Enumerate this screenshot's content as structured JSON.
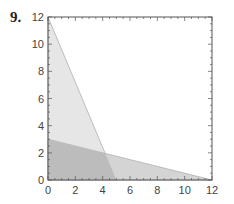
{
  "problem": {
    "number": "9."
  },
  "chart_data": {
    "type": "area",
    "title": "",
    "xlabel": "",
    "ylabel": "",
    "xlim": [
      0,
      12
    ],
    "ylim": [
      0,
      12
    ],
    "xticks": [
      0,
      2,
      4,
      6,
      8,
      10,
      12
    ],
    "yticks": [
      0,
      2,
      4,
      6,
      8,
      10,
      12
    ],
    "xtick_labels": [
      "0",
      "2",
      "4",
      "6",
      "8",
      "10",
      "12"
    ],
    "ytick_labels": [
      "0",
      "2",
      "4",
      "6",
      "8",
      "10",
      "12"
    ],
    "grid": false,
    "legend": null,
    "regions": [
      {
        "name": "steep-triangle",
        "vertices": [
          [
            0,
            0
          ],
          [
            0,
            12
          ],
          [
            5,
            0
          ]
        ],
        "boundary": "12x + 5y = 60",
        "color": "#e6e6e6"
      },
      {
        "name": "shallow-triangle",
        "vertices": [
          [
            0,
            0
          ],
          [
            0,
            3
          ],
          [
            12,
            0
          ]
        ],
        "boundary": "x + 4y = 12",
        "color": "#d4d4d4"
      }
    ],
    "overlap": {
      "vertices": [
        [
          0,
          0
        ],
        [
          0,
          3
        ],
        [
          4.19,
          1.95
        ],
        [
          5,
          0
        ]
      ],
      "color": "#bcbcbc"
    },
    "colors": {
      "axis": "#555555",
      "edge": "#b0b0b0"
    }
  }
}
